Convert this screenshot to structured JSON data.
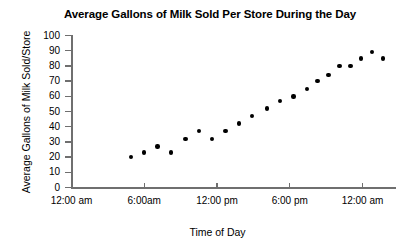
{
  "chart_data": {
    "type": "scatter",
    "title": "Average Gallons of Milk Sold Per Store During the Day",
    "xlabel": "Time of Day",
    "ylabel": "Average Gallons of Milk Sold/Store",
    "xlim": [
      0,
      26.9
    ],
    "ylim": [
      0,
      100
    ],
    "grid": false,
    "legend": false,
    "y_ticks": [
      {
        "value": 0,
        "label": "0"
      },
      {
        "value": 10,
        "label": "10"
      },
      {
        "value": 20,
        "label": "20"
      },
      {
        "value": 30,
        "label": "30"
      },
      {
        "value": 40,
        "label": "40"
      },
      {
        "value": 50,
        "label": "50"
      },
      {
        "value": 60,
        "label": "60"
      },
      {
        "value": 70,
        "label": "70"
      },
      {
        "value": 80,
        "label": "80"
      },
      {
        "value": 90,
        "label": "90"
      },
      {
        "value": 100,
        "label": "100"
      }
    ],
    "x_ticks": [
      {
        "value": 0,
        "label": "12:00 am"
      },
      {
        "value": 6,
        "label": "6:00am"
      },
      {
        "value": 12,
        "label": "12:00 pm"
      },
      {
        "value": 18,
        "label": "6:00 pm"
      },
      {
        "value": 24,
        "label": "12:00 am"
      }
    ],
    "series": [
      {
        "name": "Average gallons of milk sold per store",
        "marker": "filled-circle",
        "color": "#000000",
        "points": [
          {
            "x": 4.9,
            "y": 20
          },
          {
            "x": 6.0,
            "y": 23
          },
          {
            "x": 7.1,
            "y": 27
          },
          {
            "x": 8.2,
            "y": 23
          },
          {
            "x": 9.4,
            "y": 32
          },
          {
            "x": 10.5,
            "y": 37
          },
          {
            "x": 11.6,
            "y": 32
          },
          {
            "x": 12.7,
            "y": 37
          },
          {
            "x": 13.8,
            "y": 42
          },
          {
            "x": 14.9,
            "y": 47
          },
          {
            "x": 16.1,
            "y": 52
          },
          {
            "x": 17.2,
            "y": 57
          },
          {
            "x": 18.3,
            "y": 60
          },
          {
            "x": 19.4,
            "y": 65
          },
          {
            "x": 20.3,
            "y": 70
          },
          {
            "x": 21.2,
            "y": 74
          },
          {
            "x": 22.1,
            "y": 80
          },
          {
            "x": 23.0,
            "y": 80
          },
          {
            "x": 23.9,
            "y": 85
          },
          {
            "x": 24.8,
            "y": 89
          },
          {
            "x": 25.7,
            "y": 85
          }
        ]
      }
    ]
  }
}
